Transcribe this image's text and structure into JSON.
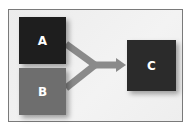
{
  "diagram": {
    "nodes": [
      {
        "id": "A",
        "label": "A",
        "color": "#1e1e1e"
      },
      {
        "id": "B",
        "label": "B",
        "color": "#6e6e6e"
      },
      {
        "id": "C",
        "label": "C",
        "color": "#2b2b2b"
      }
    ],
    "edges": [
      {
        "from": "A",
        "to": "C"
      },
      {
        "from": "B",
        "to": "C"
      }
    ],
    "arrow_color": "#8a8a8a",
    "frame_border_color": "#7a7a7a"
  }
}
